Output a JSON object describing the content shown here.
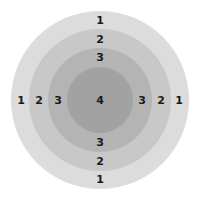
{
  "diagram": {
    "type": "concentric-rings",
    "rings": [
      {
        "level": "1",
        "color": "#dcdcdc"
      },
      {
        "level": "2",
        "color": "#c8c8c8"
      },
      {
        "level": "3",
        "color": "#b4b4b4"
      },
      {
        "level": "4",
        "color": "#a2a2a2"
      }
    ],
    "labels": {
      "top": [
        "1",
        "2",
        "3"
      ],
      "bottom": [
        "3",
        "2",
        "1"
      ],
      "left": [
        "1",
        "2",
        "3"
      ],
      "right": [
        "3",
        "2",
        "1"
      ],
      "center": "4"
    }
  }
}
